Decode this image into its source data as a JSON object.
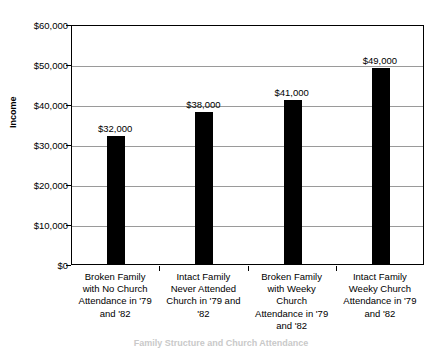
{
  "chart_data": {
    "type": "bar",
    "title": "",
    "xlabel": "Family Structure and Church Attendance",
    "ylabel": "Income",
    "ylim": [
      0,
      60000
    ],
    "ytick_step": 10000,
    "grid": true,
    "legend": "none",
    "bar_color": "#000000",
    "categories": [
      "Broken Family with No Church Attendance in '79 and '82",
      "Intact Family Never Attended Church in '79 and '82",
      "Broken Family with Weeky Church Attendance in '79 and '82",
      "Intact Family Weeky Church Attendance in '79 and '82"
    ],
    "values": [
      32000,
      38000,
      41000,
      49000
    ],
    "ytick_labels": [
      "$0",
      "$10,000",
      "$20,000",
      "$30,000",
      "$40,000",
      "$50,000",
      "$60,000"
    ],
    "ytick_values": [
      0,
      10000,
      20000,
      30000,
      40000,
      50000,
      60000
    ],
    "data_labels": [
      "$32,000",
      "$38,000",
      "$41,000",
      "$49,000"
    ]
  },
  "axis": {
    "y_title": "Income",
    "x_title": "Family Structure and Church Attendance"
  },
  "categories_wrapped": [
    "Broken Family\nwith No Church\nAttendance in '79\nand '82",
    "Intact Family\nNever Attended\nChurch in '79 and\n'82",
    "Broken Family\nwith Weeky\nChurch\nAttendance in '79\nand '82",
    "Intact Family\nWeeky Church\nAttendance in '79\nand '82"
  ]
}
